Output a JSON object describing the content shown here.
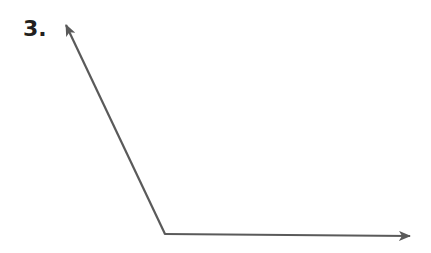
{
  "problem": {
    "number_label": "3."
  },
  "figure": {
    "type": "angle",
    "stroke_color": "#5a5a5a",
    "vertex": {
      "x": 165,
      "y": 234
    },
    "ray_upper_end": {
      "x": 66,
      "y": 25
    },
    "ray_right_end": {
      "x": 410,
      "y": 236
    }
  }
}
